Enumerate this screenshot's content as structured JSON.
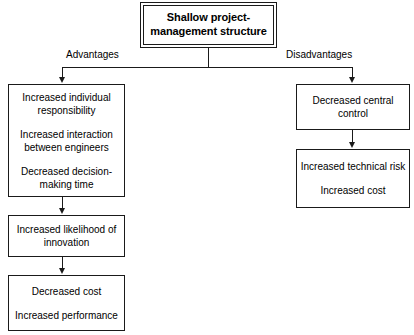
{
  "title": {
    "text": "Shallow project-management structure",
    "line1": "Shallow project-",
    "line2": "management structure"
  },
  "branches": {
    "left_label": "Advantages",
    "right_label": "Disadvantages"
  },
  "left_column": [
    {
      "id": "advantages-group-1",
      "segments": [
        "Increased individual responsibility",
        "Increased interaction between engineers",
        "Decreased decision-making time"
      ]
    },
    {
      "id": "advantages-group-2",
      "segments": [
        "Increased likelihood of innovation"
      ]
    },
    {
      "id": "advantages-group-3",
      "segments": [
        "Decreased cost",
        "Increased performance"
      ]
    }
  ],
  "right_column": [
    {
      "id": "disadvantages-group-1",
      "segments": [
        "Decreased central control"
      ]
    },
    {
      "id": "disadvantages-group-2",
      "segments": [
        "Increased technical risk",
        "Increased cost"
      ]
    }
  ],
  "colors": {
    "line": "#1a1a1a",
    "text": "#000000",
    "background": "#ffffff"
  }
}
